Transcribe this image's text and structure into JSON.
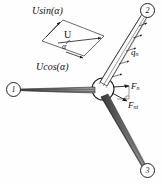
{
  "figure": {
    "type": "rotor-blade-force-diagram",
    "ink_color": "#1a1a1a",
    "background": "#ffffff"
  },
  "velocity_triangle": {
    "top_label": "Usin(α)",
    "bottom_label": "Ucos(α)",
    "resultant_label": "U",
    "angle_label": "α"
  },
  "loads": {
    "distributed_load": {
      "symbol": "q",
      "subscript": "n"
    }
  },
  "forces": [
    {
      "symbol": "F",
      "subscript": "n",
      "name": "normal-force"
    },
    {
      "symbol": "F",
      "subscript": "nt",
      "name": "tangential-force"
    }
  ],
  "blade_markers": [
    {
      "id": "1",
      "label": "1",
      "position": "left"
    },
    {
      "id": "2",
      "label": "2",
      "position": "top-right"
    },
    {
      "id": "3",
      "label": "3",
      "position": "bottom-right"
    }
  ]
}
